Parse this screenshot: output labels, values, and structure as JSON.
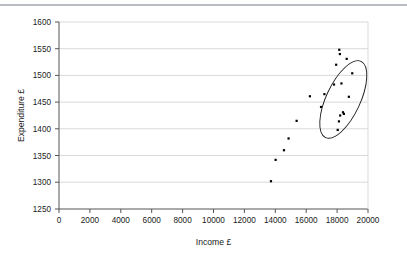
{
  "figure": {
    "name": "income-expenditure-scatter-figure",
    "has_top_rule": true,
    "background_color": "#ffffff"
  },
  "chart_data": {
    "type": "scatter",
    "title": "",
    "xlabel": "Income £",
    "ylabel": "Expenditure £",
    "xlim": [
      0,
      20000
    ],
    "ylim": [
      1250,
      1600
    ],
    "xticks": [
      0,
      2000,
      4000,
      6000,
      8000,
      10000,
      12000,
      14000,
      16000,
      18000,
      20000
    ],
    "yticks": [
      1250,
      1300,
      1350,
      1400,
      1450,
      1500,
      1550,
      1600
    ],
    "xtick_labels": [
      "0",
      "2000",
      "4000",
      "6000",
      "8000",
      "10000",
      "12000",
      "14000",
      "16000",
      "18000",
      "20000"
    ],
    "ytick_labels": [
      "1250",
      "1300",
      "1350",
      "1400",
      "1450",
      "1500",
      "1550",
      "1600"
    ],
    "grid": {
      "horizontal": true,
      "vertical": false,
      "color": "#d9d9d9"
    },
    "legend": null,
    "legend_position": "none",
    "marker": {
      "shape": "square",
      "color": "#000000",
      "size_px": 2.2
    },
    "series": [
      {
        "name": "Households",
        "points": [
          {
            "x": 13720,
            "y": 1302
          },
          {
            "x": 14020,
            "y": 1342
          },
          {
            "x": 14560,
            "y": 1360
          },
          {
            "x": 14860,
            "y": 1382
          },
          {
            "x": 15380,
            "y": 1415
          },
          {
            "x": 16240,
            "y": 1461
          },
          {
            "x": 16960,
            "y": 1441
          },
          {
            "x": 17180,
            "y": 1465
          },
          {
            "x": 17800,
            "y": 1483
          },
          {
            "x": 17940,
            "y": 1520
          },
          {
            "x": 18140,
            "y": 1548
          },
          {
            "x": 18180,
            "y": 1540
          },
          {
            "x": 18280,
            "y": 1485
          },
          {
            "x": 18620,
            "y": 1531
          },
          {
            "x": 18040,
            "y": 1398
          },
          {
            "x": 18120,
            "y": 1414
          },
          {
            "x": 18200,
            "y": 1425
          },
          {
            "x": 18380,
            "y": 1431
          },
          {
            "x": 18440,
            "y": 1428
          },
          {
            "x": 18760,
            "y": 1460
          },
          {
            "x": 18980,
            "y": 1504
          }
        ]
      }
    ],
    "annotations": [
      {
        "type": "ellipse",
        "name": "highlight-ellipse",
        "center": {
          "x": 18400,
          "y": 1455
        },
        "rx_px": 17,
        "ry_px": 42,
        "rotation_deg": 25,
        "stroke": "#1a1a1a",
        "fill": "none",
        "encloses_points": 7
      }
    ]
  }
}
